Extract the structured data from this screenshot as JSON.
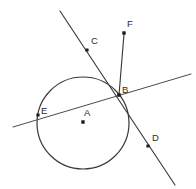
{
  "figure": {
    "canvas": {
      "width": 196,
      "height": 189
    },
    "background_color": "#ffffff",
    "stroke_color": "#3a3a3a",
    "label_color": "#2b2b2b",
    "point_color": "#1c1c1c"
  },
  "circle": {
    "name": "circle-A",
    "center": {
      "x": 83,
      "y": 123
    },
    "radius": 46
  },
  "points": [
    {
      "id": "A",
      "label": "A",
      "role": "center",
      "dot": {
        "x": 83,
        "y": 122
      },
      "label_pos": {
        "x": 84,
        "y": 116
      },
      "has_dot": true
    },
    {
      "id": "B",
      "label": "B",
      "role": "tangent-point",
      "dot": {
        "x": 119,
        "y": 95
      },
      "label_pos": {
        "x": 122,
        "y": 93
      },
      "has_dot": true
    },
    {
      "id": "C",
      "label": "C",
      "role": "ray-marker",
      "dot": {
        "x": 87,
        "y": 50
      },
      "label_pos": {
        "x": 91,
        "y": 44
      },
      "has_dot": true
    },
    {
      "id": "D",
      "label": "D",
      "role": "ray-marker",
      "dot": {
        "x": 148,
        "y": 146
      },
      "label_pos": {
        "x": 152,
        "y": 141
      },
      "has_dot": true
    },
    {
      "id": "E",
      "label": "E",
      "role": "secant-point",
      "dot": {
        "x": 38,
        "y": 115
      },
      "label_pos": {
        "x": 41,
        "y": 114
      },
      "has_dot": true
    },
    {
      "id": "F",
      "label": "F",
      "role": "ray-endpoint",
      "dot": {
        "x": 124,
        "y": 33
      },
      "label_pos": {
        "x": 127,
        "y": 27
      },
      "has_dot": true
    }
  ],
  "lines": [
    {
      "id": "line-CD",
      "label": "line through C, B and D",
      "from": {
        "x": 60,
        "y": 11
      },
      "to": {
        "x": 175,
        "y": 185
      },
      "passes_through": [
        "C",
        "B",
        "D"
      ],
      "weight": "normal"
    },
    {
      "id": "line-EB",
      "label": "secant through E and B",
      "from": {
        "x": 13,
        "y": 127
      },
      "to": {
        "x": 191,
        "y": 74
      },
      "passes_through": [
        "E",
        "B"
      ],
      "weight": "thin"
    },
    {
      "id": "ray-BF",
      "label": "ray from B to F",
      "from": {
        "x": 119,
        "y": 95
      },
      "to": {
        "x": 124,
        "y": 34
      },
      "passes_through": [
        "B",
        "F"
      ],
      "weight": "normal"
    }
  ]
}
